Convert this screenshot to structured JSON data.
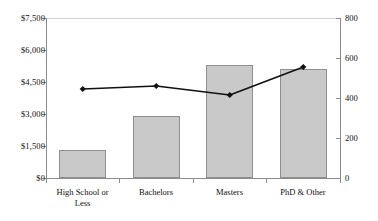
{
  "chart_data": {
    "type": "bar",
    "title": "",
    "subtitle": "",
    "xlabel": "",
    "ylabel": "",
    "grid": false,
    "legend": "none",
    "categories": [
      "High School or Less",
      "Bachelors",
      "Masters",
      "PhD & Other"
    ],
    "axes": {
      "left": {
        "label": "",
        "ylim": [
          0,
          7500
        ],
        "ticks": [
          0,
          1500,
          3000,
          4500,
          6000,
          7500
        ],
        "ticklabels": [
          "$0",
          "$1,500",
          "$3,000",
          "$4,500",
          "$6,000",
          "$7,500"
        ],
        "prefix": "$"
      },
      "right": {
        "label": "",
        "ylim": [
          0,
          800
        ],
        "ticks": [
          0,
          200,
          400,
          600,
          800
        ],
        "ticklabels": [
          "0",
          "200",
          "400",
          "600",
          "800"
        ]
      }
    },
    "series": [
      {
        "name": "bars",
        "type": "bar",
        "axis": "left",
        "values": [
          1300,
          2900,
          5300,
          5100
        ],
        "fill": "#c9c9c9",
        "stroke": "#8f8f8f"
      },
      {
        "name": "line",
        "type": "line",
        "axis": "right",
        "values": [
          445,
          460,
          415,
          555
        ],
        "stroke": "#111111",
        "marker": "diamond"
      }
    ]
  },
  "xaxis_labels": [
    {
      "line1": "High School or",
      "line2": "Less"
    },
    {
      "line1": "Bachelors",
      "line2": ""
    },
    {
      "line1": "Masters",
      "line2": ""
    },
    {
      "line1": "PhD & Other",
      "line2": ""
    }
  ],
  "left_ticklabels": [
    "$7,500",
    "$6,000",
    "$4,500",
    "$3,000",
    "$1,500",
    "$0"
  ],
  "right_ticklabels": [
    "800",
    "600",
    "400",
    "200",
    "0"
  ]
}
